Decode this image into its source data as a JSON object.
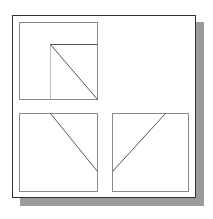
{
  "diagram": {
    "type": "orthographic-projection",
    "colors": {
      "frame": "#333333",
      "shadow": "#9a9a9a",
      "view_border": "#8a8a8a",
      "edge_line": "#555555",
      "hidden_light_line": "#bbbbbb",
      "background": "#ffffff"
    },
    "frame": {
      "x": 12,
      "y": 15,
      "width": 184,
      "height": 183
    },
    "shadow": {
      "offset_x": 8,
      "offset_y": 8
    },
    "views": [
      {
        "name": "top-view",
        "box": {
          "x": 19,
          "y": 22,
          "width": 78,
          "height": 77
        },
        "lines": [
          {
            "x1": 50,
            "y1": 44,
            "x2": 50,
            "y2": 99,
            "style": "light"
          },
          {
            "x1": 50,
            "y1": 44,
            "x2": 97,
            "y2": 44,
            "style": "edge"
          },
          {
            "x1": 50,
            "y1": 44,
            "x2": 97,
            "y2": 99,
            "style": "edge"
          }
        ]
      },
      {
        "name": "front-view",
        "box": {
          "x": 19,
          "y": 113,
          "width": 78,
          "height": 78
        },
        "lines": [
          {
            "x1": 50,
            "y1": 113,
            "x2": 97,
            "y2": 171,
            "style": "edge"
          }
        ]
      },
      {
        "name": "side-view",
        "box": {
          "x": 112,
          "y": 113,
          "width": 76,
          "height": 78
        },
        "lines": [
          {
            "x1": 165,
            "y1": 113,
            "x2": 112,
            "y2": 171,
            "style": "edge"
          }
        ]
      }
    ]
  }
}
